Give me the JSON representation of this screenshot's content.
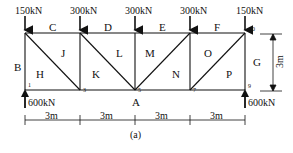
{
  "diagram": {
    "caption": "(a)",
    "loads_top": [
      {
        "node": "2",
        "label": "150kN"
      },
      {
        "node": "4",
        "label": "300kN"
      },
      {
        "node": "6",
        "label": "300kN"
      },
      {
        "node": "8",
        "label": "300kN"
      },
      {
        "node": "10",
        "label": "150kN"
      }
    ],
    "reactions": [
      {
        "node": "1",
        "label": "600kN"
      },
      {
        "node": "9",
        "label": "600kN"
      }
    ],
    "node_numbers": [
      "1",
      "2",
      "3",
      "4",
      "5",
      "6",
      "7",
      "8",
      "9",
      "10"
    ],
    "space_labels": {
      "B": "B",
      "C": "C",
      "D": "D",
      "E": "E",
      "F": "F",
      "G": "G",
      "H": "H",
      "J": "J",
      "K": "K",
      "L": "L",
      "M": "M",
      "N": "N",
      "O": "O",
      "P": "P",
      "A": "A"
    },
    "dimensions": {
      "spans": [
        "3m",
        "3m",
        "3m",
        "3m"
      ],
      "height": "3m"
    },
    "colors": {
      "line": "#111111",
      "background": "#ffffff"
    }
  }
}
